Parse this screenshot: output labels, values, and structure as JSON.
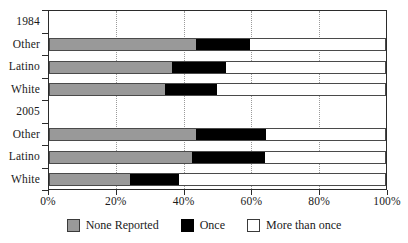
{
  "chart_data": {
    "type": "bar",
    "subtype": "stacked-horizontal-100pct",
    "title": "",
    "xlabel": "",
    "ylabel": "",
    "xlim": [
      0,
      100
    ],
    "xticks": [
      0,
      20,
      40,
      60,
      80,
      100
    ],
    "xticklabels": [
      "0%",
      "20%",
      "40%",
      "60%",
      "80%",
      "100%"
    ],
    "grid": "vertical-dotted",
    "legend_position": "bottom-center",
    "groups": [
      {
        "label": "1984",
        "categories": [
          "Other",
          "Latino",
          "White"
        ]
      },
      {
        "label": "2005",
        "categories": [
          "Other",
          "Latino",
          "White"
        ]
      }
    ],
    "categories": [
      "1984 Other",
      "1984 Latino",
      "1984 White",
      "2005 Other",
      "2005 Latino",
      "2005 White"
    ],
    "series": [
      {
        "name": "None Reported",
        "color": "#999999",
        "values": [
          43.5,
          36.5,
          34.5,
          43.5,
          42.5,
          24.0
        ]
      },
      {
        "name": "Once",
        "color": "#000000",
        "values": [
          16.0,
          16.0,
          15.5,
          21.0,
          21.5,
          14.5
        ]
      },
      {
        "name": "More than once",
        "color": "#ffffff",
        "values": [
          40.5,
          47.5,
          50.0,
          35.5,
          36.0,
          61.5
        ]
      }
    ]
  },
  "axis": {
    "y_entries": [
      {
        "text": "1984",
        "kind": "group"
      },
      {
        "text": "Other",
        "kind": "category"
      },
      {
        "text": "Latino",
        "kind": "category"
      },
      {
        "text": "White",
        "kind": "category"
      },
      {
        "text": "2005",
        "kind": "group"
      },
      {
        "text": "Other",
        "kind": "category"
      },
      {
        "text": "Latino",
        "kind": "category"
      },
      {
        "text": "White",
        "kind": "category"
      }
    ],
    "x_tick_labels": [
      "0%",
      "20%",
      "40%",
      "60%",
      "80%",
      "100%"
    ]
  },
  "legend": {
    "items": [
      {
        "label": "None Reported",
        "swatch": "none-reported"
      },
      {
        "label": "Once",
        "swatch": "once"
      },
      {
        "label": "More than once",
        "swatch": "more-than-once"
      }
    ]
  },
  "colors": {
    "none_reported": "#999999",
    "once": "#000000",
    "more_than_once": "#ffffff",
    "axis": "#2b2b2b",
    "grid": "#9a9a9a"
  }
}
